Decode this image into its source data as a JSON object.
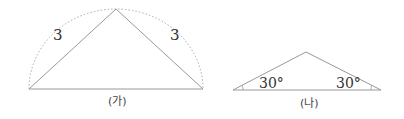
{
  "figure_a": {
    "caption": "(가)",
    "left_side_label": "3",
    "right_side_label": "3",
    "line_color": "#999999"
  },
  "figure_b": {
    "caption": "(나)",
    "left_angle_label": "30°",
    "right_angle_label": "30°",
    "line_color": "#999999"
  }
}
